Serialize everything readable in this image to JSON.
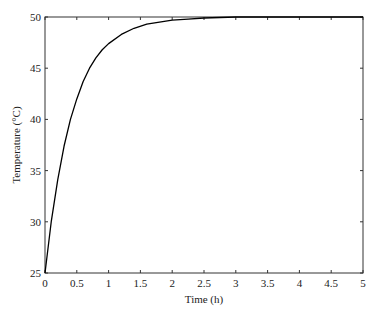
{
  "chart_data": {
    "type": "line",
    "title": "",
    "xlabel": "Time (h)",
    "ylabel": "Temperature (°C)",
    "xlim": [
      0,
      5
    ],
    "ylim": [
      25,
      50
    ],
    "xticks": [
      0,
      0.5,
      1,
      1.5,
      2,
      2.5,
      3,
      3.5,
      4,
      4.5,
      5
    ],
    "xtick_labels": [
      "0",
      "0.5",
      "1",
      "1.5",
      "2",
      "2.5",
      "3",
      "3.5",
      "4",
      "4.5",
      "5"
    ],
    "yticks": [
      25,
      30,
      35,
      40,
      45,
      50
    ],
    "ytick_labels": [
      "25",
      "30",
      "35",
      "40",
      "45",
      "50"
    ],
    "grid": false,
    "legend": null,
    "series": [
      {
        "name": "Temperature",
        "color": "#000000",
        "x": [
          0,
          0.1,
          0.2,
          0.3,
          0.4,
          0.5,
          0.6,
          0.7,
          0.8,
          0.9,
          1.0,
          1.2,
          1.4,
          1.6,
          1.8,
          2.0,
          2.25,
          2.5,
          2.75,
          3.0,
          3.5,
          4.0,
          4.5,
          5.0
        ],
        "y": [
          25.0,
          30.1,
          34.1,
          37.4,
          40.0,
          42.0,
          43.7,
          45.0,
          46.0,
          46.8,
          47.4,
          48.3,
          48.9,
          49.3,
          49.5,
          49.7,
          49.8,
          49.9,
          49.95,
          50.0,
          50.0,
          50.0,
          50.0,
          50.0
        ]
      }
    ]
  }
}
